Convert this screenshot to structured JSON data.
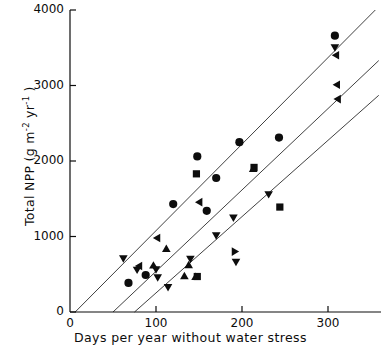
{
  "chart_data": {
    "type": "scatter",
    "title": "",
    "xlabel": "Days per year without water stress",
    "ylabel": "Total NPP (g m-2 yr-1)",
    "ylabel_parts": {
      "prefix": "Total NPP (g m",
      "sup1": "-2",
      "mid": " yr",
      "sup2": "-1",
      "suffix": " )"
    },
    "xlim": [
      0,
      360
    ],
    "ylim": [
      0,
      4000
    ],
    "xticks": [
      0,
      100,
      200,
      300
    ],
    "yticks": [
      0,
      1000,
      2000,
      3000,
      4000
    ],
    "xticklabels": [
      "0",
      "100",
      "200",
      "300"
    ],
    "yticklabels": [
      "0",
      "1000",
      "2000",
      "3000",
      "4000"
    ],
    "grid": false,
    "legend": "none",
    "marker_color": "#0d0d0d",
    "line_color": "#2b2b2b",
    "series": [
      {
        "name": "circle",
        "marker": "circle",
        "points": [
          {
            "x": 68,
            "y": 385
          },
          {
            "x": 88,
            "y": 490
          },
          {
            "x": 120,
            "y": 1430
          },
          {
            "x": 148,
            "y": 2060
          },
          {
            "x": 159,
            "y": 1340
          },
          {
            "x": 170,
            "y": 1775
          },
          {
            "x": 197,
            "y": 2250
          },
          {
            "x": 243,
            "y": 2310
          },
          {
            "x": 308,
            "y": 3660
          }
        ]
      },
      {
        "name": "square",
        "marker": "square",
        "points": [
          {
            "x": 147,
            "y": 1830
          },
          {
            "x": 148,
            "y": 470
          },
          {
            "x": 214,
            "y": 1915
          },
          {
            "x": 244,
            "y": 1390
          }
        ]
      },
      {
        "name": "down-triangle",
        "marker": "triangle-down",
        "points": [
          {
            "x": 62,
            "y": 705
          },
          {
            "x": 78,
            "y": 555
          },
          {
            "x": 100,
            "y": 560
          },
          {
            "x": 102,
            "y": 455
          },
          {
            "x": 114,
            "y": 325
          },
          {
            "x": 140,
            "y": 700
          },
          {
            "x": 170,
            "y": 1010
          },
          {
            "x": 190,
            "y": 1245
          },
          {
            "x": 193,
            "y": 660
          },
          {
            "x": 231,
            "y": 1555
          },
          {
            "x": 308,
            "y": 3500
          }
        ]
      },
      {
        "name": "left-triangle",
        "marker": "triangle-left",
        "points": [
          {
            "x": 80,
            "y": 610
          },
          {
            "x": 101,
            "y": 980
          },
          {
            "x": 150,
            "y": 1455
          },
          {
            "x": 309,
            "y": 3400
          },
          {
            "x": 310,
            "y": 3010
          },
          {
            "x": 311,
            "y": 2820
          }
        ]
      },
      {
        "name": "up-triangle",
        "marker": "triangle-up",
        "points": [
          {
            "x": 97,
            "y": 620
          },
          {
            "x": 112,
            "y": 840
          },
          {
            "x": 133,
            "y": 480
          },
          {
            "x": 138,
            "y": 625
          },
          {
            "x": 146,
            "y": 470
          },
          {
            "x": 213,
            "y": 1900
          }
        ]
      },
      {
        "name": "right-triangle",
        "marker": "triangle-right",
        "points": [
          {
            "x": 192,
            "y": 800
          }
        ]
      }
    ],
    "regression_lines": [
      {
        "name": "upper-line",
        "x0": 6,
        "y0": 0,
        "x1": 355,
        "y1": 4000
      },
      {
        "name": "middle-line",
        "x0": 50,
        "y0": 0,
        "x1": 359,
        "y1": 3330
      },
      {
        "name": "lower-line",
        "x0": 75,
        "y0": 0,
        "x1": 359,
        "y1": 2870
      }
    ]
  }
}
